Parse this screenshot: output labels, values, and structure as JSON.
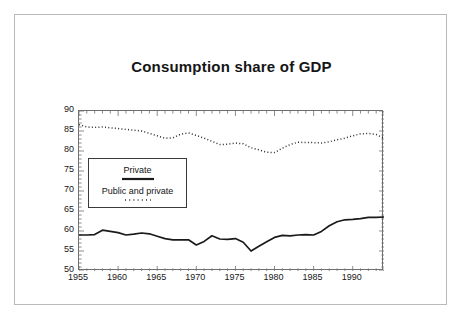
{
  "chart_data": {
    "type": "line",
    "title": "Consumption share of GDP",
    "xlabel": "",
    "ylabel": "",
    "xlim": [
      1955,
      1994
    ],
    "ylim": [
      50,
      90
    ],
    "ytick_labels": [
      "50",
      "55",
      "60",
      "65",
      "70",
      "75",
      "80",
      "85",
      "90"
    ],
    "ytick_values": [
      50,
      55,
      60,
      65,
      70,
      75,
      80,
      85,
      90
    ],
    "xtick_labels": [
      "1955",
      "1960",
      "1965",
      "1970",
      "1975",
      "1980",
      "1985",
      "1990"
    ],
    "xtick_values": [
      1955,
      1960,
      1965,
      1970,
      1975,
      1980,
      1985,
      1990
    ],
    "grid": false,
    "legend_position": "center-left",
    "x": [
      1955,
      1956,
      1957,
      1958,
      1959,
      1960,
      1961,
      1962,
      1963,
      1964,
      1965,
      1966,
      1967,
      1968,
      1969,
      1970,
      1971,
      1972,
      1973,
      1974,
      1975,
      1976,
      1977,
      1978,
      1979,
      1980,
      1981,
      1982,
      1983,
      1984,
      1985,
      1986,
      1987,
      1988,
      1989,
      1990,
      1991,
      1992,
      1993,
      1994
    ],
    "series": [
      {
        "name": "Private",
        "style": "solid",
        "color": "#1a1a1a",
        "values": [
          59.0,
          59.0,
          59.1,
          60.2,
          59.9,
          59.6,
          59.0,
          59.2,
          59.5,
          59.3,
          58.7,
          58.1,
          57.8,
          57.8,
          57.8,
          56.5,
          57.4,
          58.8,
          58.0,
          57.9,
          58.1,
          57.2,
          55.0,
          56.2,
          57.3,
          58.4,
          58.9,
          58.8,
          59.0,
          59.1,
          59.0,
          59.9,
          61.3,
          62.3,
          62.8,
          62.9,
          63.1,
          63.4,
          63.4,
          63.5
        ]
      },
      {
        "name": "Public and private",
        "style": "dotted",
        "color": "#2b2b2b",
        "values": [
          86.6,
          86.0,
          85.9,
          86.0,
          85.8,
          85.6,
          85.4,
          85.2,
          85.0,
          84.4,
          83.8,
          83.2,
          83.3,
          84.2,
          84.5,
          83.9,
          83.2,
          82.4,
          81.6,
          81.7,
          82.0,
          81.8,
          80.8,
          80.3,
          79.7,
          79.6,
          80.7,
          81.6,
          82.2,
          82.1,
          82.1,
          82.0,
          82.3,
          82.8,
          83.2,
          83.8,
          84.3,
          84.4,
          84.1,
          83.2
        ]
      }
    ],
    "legend": [
      {
        "label": "Private",
        "style": "solid"
      },
      {
        "label": "Public and private",
        "style": "dotted"
      }
    ]
  }
}
